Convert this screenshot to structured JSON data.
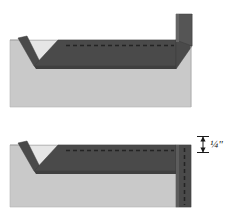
{
  "figure": {
    "background_color": "#ffffff",
    "width": 231,
    "height": 221
  },
  "colors": {
    "substrate_light_gray": "#c9c9c9",
    "board_dark_gray": "#4a4a4a",
    "board_edge_shade": "#5a5a5a",
    "groove_highlight": "#e0e0e0",
    "dashed_line": "#2b2b2b",
    "outline": "#8c8c8c",
    "label_text": "#1a1a1a",
    "dimension_arrow": "#1a1a1a"
  },
  "panels": [
    {
      "id": "upper-panel",
      "name": "Panel showing board folded up at right edge",
      "substrate_label": "",
      "board_label": "",
      "has_vertical_riser": true,
      "has_dimension_callout": false,
      "dashed_line_visible": true,
      "v_groove_visible": true
    },
    {
      "id": "lower-panel",
      "name": "Panel showing board flat with quarter inch offset at right edge",
      "substrate_label": "",
      "board_label": "",
      "has_vertical_riser": false,
      "has_dimension_callout": true,
      "dashed_line_visible": true,
      "v_groove_visible": true
    }
  ],
  "dimension_callout": {
    "label": "¼\"",
    "value": "1/4",
    "unit": "inch",
    "arrow_style": "double-headed-vertical",
    "position": "right-of-lower-panel"
  },
  "annotations": {
    "upper_dashed_note": "",
    "lower_dashed_note": ""
  }
}
